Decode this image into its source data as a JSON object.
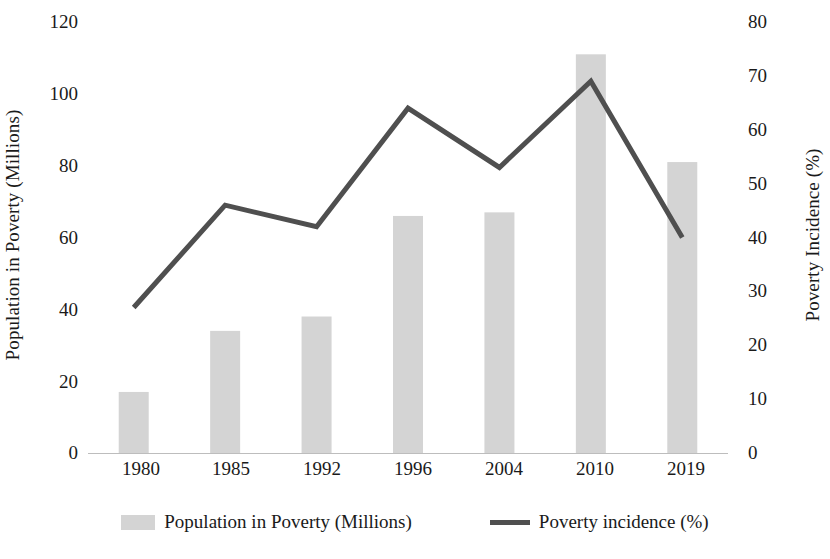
{
  "chart_data": {
    "type": "bar",
    "title": "",
    "xlabel": "",
    "categories": [
      "1980",
      "1985",
      "1992",
      "1996",
      "2004",
      "2010",
      "2019"
    ],
    "grid": false,
    "legend_position": "bottom",
    "series": [
      {
        "name": "Population in Poverty (Millions)",
        "type": "bar",
        "axis": "left",
        "color": "#d4d4d4",
        "values": [
          17,
          34,
          38,
          66,
          67,
          111,
          81
        ]
      },
      {
        "name": "Poverty incidence (%)",
        "type": "line",
        "axis": "right",
        "color": "#4f4f4f",
        "values": [
          27,
          46,
          42,
          64,
          53,
          69,
          40
        ]
      }
    ],
    "axes": {
      "left": {
        "label": "Population in Poverty (Millions)",
        "ylim": [
          0,
          120
        ],
        "ticks": [
          0,
          20,
          40,
          60,
          80,
          100,
          120
        ],
        "tick_labels": [
          "0",
          "20",
          "40",
          "60",
          "80",
          "100",
          "120"
        ]
      },
      "right": {
        "label": "Poverty Incidence (%)",
        "ylim": [
          0,
          80
        ],
        "ticks": [
          0,
          10,
          20,
          30,
          40,
          50,
          60,
          70,
          80
        ],
        "tick_labels": [
          "0",
          "10",
          "20",
          "30",
          "40",
          "50",
          "60",
          "70",
          "80"
        ]
      }
    }
  },
  "legend": {
    "items": [
      {
        "label": "Population in Poverty (Millions)"
      },
      {
        "label": "Poverty incidence (%)"
      }
    ]
  }
}
